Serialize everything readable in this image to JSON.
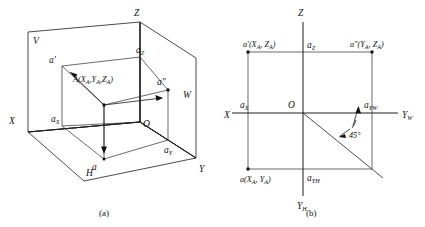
{
  "figure": {
    "title_a": "Spatial point A in three projection planes",
    "title_b": "Unfolded projection drawing of point A",
    "captions": {
      "a": "(a)",
      "b": "(b)"
    },
    "colors": {
      "line": "#1c1c1c",
      "background": "#ffffff",
      "text": "#111111"
    }
  },
  "panel_a": {
    "plane_labels": [
      {
        "id": "plane-v",
        "text": "V"
      },
      {
        "id": "plane-h",
        "text": "H"
      },
      {
        "id": "plane-w",
        "text": "W"
      }
    ],
    "axis_labels": [
      {
        "id": "axis-x",
        "text": "X"
      },
      {
        "id": "axis-y",
        "text": "Y"
      },
      {
        "id": "axis-z",
        "text": "Z"
      }
    ],
    "origin_label": "O",
    "point_labels": [
      {
        "id": "point-a-front",
        "base": "a",
        "prime": "′"
      },
      {
        "id": "point-a-side",
        "base": "a",
        "prime": "″"
      },
      {
        "id": "point-a-top",
        "base": "a",
        "prime": ""
      }
    ],
    "foot_labels": [
      {
        "id": "foot-ax",
        "base": "a",
        "sub": "X"
      },
      {
        "id": "foot-ay",
        "base": "a",
        "sub": "Y"
      },
      {
        "id": "foot-az",
        "base": "a",
        "sub": "Z"
      }
    ],
    "space_point": {
      "id": "space-point-A",
      "text": "A(X",
      "sub1": "A",
      "mid1": ",Y",
      "sub2": "A",
      "mid2": ",Z",
      "sub3": "A",
      "close": ")",
      "full": "A(XA,YA,ZA)"
    }
  },
  "panel_b": {
    "axis_labels": [
      {
        "id": "axis-x",
        "text": "X"
      },
      {
        "id": "axis-z",
        "text": "Z"
      },
      {
        "id": "axis-yw",
        "base": "Y",
        "sub": "W"
      },
      {
        "id": "axis-yh",
        "base": "Y",
        "sub": "H"
      }
    ],
    "origin_label": "O",
    "projections": [
      {
        "id": "proj-front",
        "base": "a",
        "prime": "′",
        "coords_open": "(X",
        "sub1": "A",
        "mid": ", Z",
        "sub2": "A",
        "close": ")"
      },
      {
        "id": "proj-side",
        "base": "a",
        "prime": "″",
        "coords_open": "(Y",
        "sub1": "A",
        "mid": ", Z",
        "sub2": "A",
        "close": ")"
      },
      {
        "id": "proj-top",
        "base": "a",
        "prime": "",
        "coords_open": "(X",
        "sub1": "A",
        "mid": ", Y",
        "sub2": "A",
        "close": ")"
      }
    ],
    "foot_labels": [
      {
        "id": "foot-ax",
        "base": "a",
        "sub": "X"
      },
      {
        "id": "foot-az",
        "base": "a",
        "sub": "Z"
      },
      {
        "id": "foot-ayw",
        "base": "a",
        "sub": "YW"
      },
      {
        "id": "foot-ayh",
        "base": "a",
        "sub": "YH"
      }
    ],
    "angle_annotation": {
      "id": "angle-45",
      "value": "45",
      "unit": "°",
      "text": "45°"
    }
  }
}
